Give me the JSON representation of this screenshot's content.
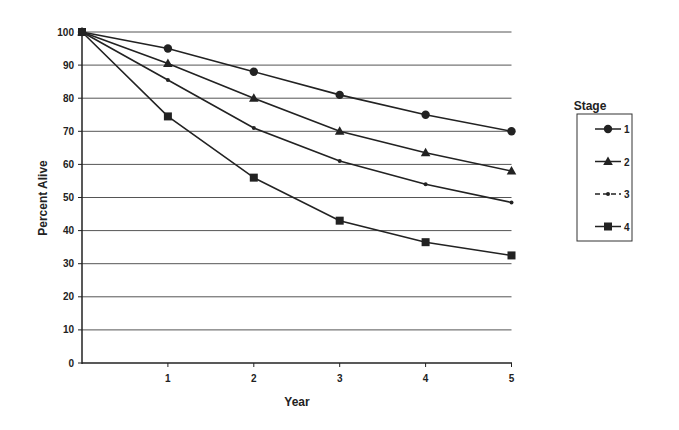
{
  "chart_data": {
    "type": "line",
    "title": "",
    "xlabel": "Year",
    "ylabel": "Percent Alive",
    "x": [
      0,
      1,
      2,
      3,
      4,
      5
    ],
    "x_tick_labels": [
      "1",
      "2",
      "3",
      "4",
      "5"
    ],
    "y_tick_labels": [
      "0",
      "10",
      "20",
      "30",
      "40",
      "50",
      "60",
      "70",
      "80",
      "90",
      "100"
    ],
    "ylim": [
      0,
      100
    ],
    "xlim": [
      0,
      5
    ],
    "grid": "horizontal",
    "legend": {
      "title": "Stage",
      "position": "right"
    },
    "series": [
      {
        "name": "1",
        "marker": "circle",
        "values": [
          100,
          95,
          88,
          81,
          75,
          70
        ]
      },
      {
        "name": "2",
        "marker": "triangle",
        "values": [
          100,
          90.5,
          80,
          70,
          63.5,
          58
        ]
      },
      {
        "name": "3",
        "marker": "dot",
        "values": [
          100,
          85.5,
          71,
          61,
          54,
          48.5
        ]
      },
      {
        "name": "4",
        "marker": "square",
        "values": [
          100,
          74.5,
          56,
          43,
          36.5,
          32.5
        ]
      }
    ]
  },
  "colors": {
    "line": "#222222",
    "grid": "#555555",
    "background": "#ffffff"
  }
}
